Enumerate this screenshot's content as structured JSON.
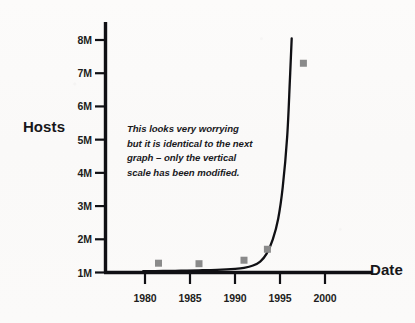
{
  "chart_data": {
    "type": "line",
    "title": "",
    "subtitle": "",
    "xlabel": "Date",
    "ylabel": "Hosts",
    "xlim": [
      1977.0,
      2003.5
    ],
    "ylim": [
      1000000,
      8400000
    ],
    "grid": false,
    "legend": null,
    "xticks": [
      1980,
      1985,
      1990,
      1995,
      2000
    ],
    "xtick_labels": [
      "1980",
      "1985",
      "1990",
      "1995",
      "2000"
    ],
    "yticks": [
      1000000,
      2000000,
      3000000,
      4000000,
      5000000,
      6000000,
      7000000,
      8000000
    ],
    "ytick_labels": [
      "1M",
      "2M",
      "3M",
      "4M",
      "5M",
      "6M",
      "7M",
      "8M"
    ],
    "series": [
      {
        "name": "Hosts trend curve",
        "type": "line",
        "color": "#101014",
        "x": [
          1979.8,
          1982.0,
          1984.0,
          1986.0,
          1988.0,
          1990.0,
          1991.0,
          1992.0,
          1992.8,
          1993.5,
          1994.2,
          1994.8,
          1995.3,
          1995.8,
          1996.1,
          1996.3
        ],
        "y": [
          1040000,
          1045000,
          1055000,
          1065000,
          1080000,
          1110000,
          1140000,
          1210000,
          1330000,
          1560000,
          2000000,
          2620000,
          3560000,
          5100000,
          6800000,
          8050000
        ]
      },
      {
        "name": "Measured hosts",
        "type": "scatter",
        "color": "#8a8a8a",
        "marker": "square",
        "x": [
          1981.5,
          1986.0,
          1991.0,
          1993.6,
          1997.6
        ],
        "y": [
          1280000,
          1265000,
          1370000,
          1700000,
          7300000
        ]
      }
    ],
    "annotations": [
      {
        "name": "scale-warning-note",
        "text": "This looks very worrying but it is identical to the next graph – only the vertical scale has been modified.",
        "x": 1981.0,
        "y": 5100000,
        "style": "italic"
      }
    ]
  },
  "axes": {
    "y_title": "Hosts",
    "x_title": "Date"
  },
  "colors": {
    "ink": "#101014",
    "marker": "#8a8a8a",
    "paper": "#fbfbfa"
  }
}
